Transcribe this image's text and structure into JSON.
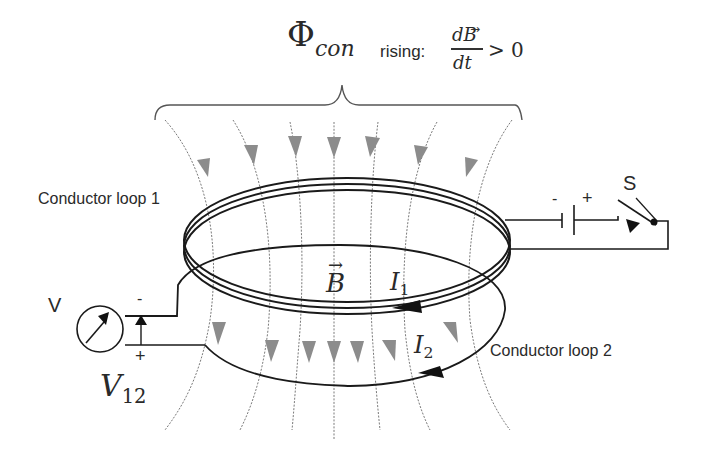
{
  "title": {
    "flux_symbol": "Φ",
    "flux_subscript": "con",
    "rising_label": "rising:",
    "fraction_numerator": "dB",
    "fraction_denominator": "dt",
    "inequality": "> 0"
  },
  "labels": {
    "loop1": "Conductor loop 1",
    "loop2": "Conductor loop 2",
    "switch": "S",
    "battery_minus": "-",
    "battery_plus": "+",
    "voltmeter": "V",
    "volt_minus": "-",
    "volt_plus": "+",
    "v12_main": "V",
    "v12_sub": "12",
    "b_field": "B",
    "i1_main": "I",
    "i1_sub": "1",
    "i2_main": "I",
    "i2_sub": "2"
  },
  "colors": {
    "field_line": "#7a7a7a",
    "arrow_fill": "#8c8c8c",
    "conductor": "#1a1a1a",
    "text": "#2a2a2a"
  }
}
